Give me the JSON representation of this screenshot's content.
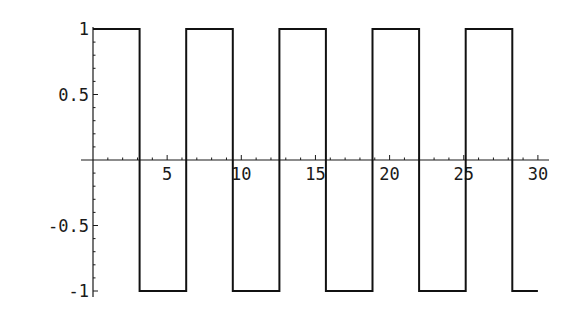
{
  "chart_data": {
    "type": "line",
    "title": "",
    "xlabel": "",
    "ylabel": "",
    "xlim": [
      0,
      30
    ],
    "ylim": [
      -1,
      1
    ],
    "grid": false,
    "legend": null,
    "x_ticks": [
      5,
      10,
      15,
      20,
      25,
      30
    ],
    "x_tick_labels": [
      "5",
      "10",
      "15",
      "20",
      "25",
      "30"
    ],
    "y_ticks": [
      1,
      0.5,
      -0.5,
      -1
    ],
    "y_tick_labels": [
      "1",
      "0.5",
      "-0.5",
      "-1"
    ],
    "series": [
      {
        "name": "square wave",
        "color": "#111111",
        "x": [
          0,
          3.1416,
          3.1416,
          6.2832,
          6.2832,
          9.4248,
          9.4248,
          12.5664,
          12.5664,
          15.708,
          15.708,
          18.8496,
          18.8496,
          21.9911,
          21.9911,
          25.1327,
          25.1327,
          28.2743,
          28.2743,
          30
        ],
        "values": [
          1,
          1,
          -1,
          -1,
          1,
          1,
          -1,
          -1,
          1,
          1,
          -1,
          -1,
          1,
          1,
          -1,
          -1,
          1,
          1,
          -1,
          -1
        ]
      }
    ]
  },
  "layout": {
    "origin_px": [
      93,
      160
    ],
    "px_per_x": 14.83,
    "px_per_y": 131,
    "x_axis_px": [
      81,
      549
    ],
    "y_axis_px": [
      27,
      297
    ]
  }
}
